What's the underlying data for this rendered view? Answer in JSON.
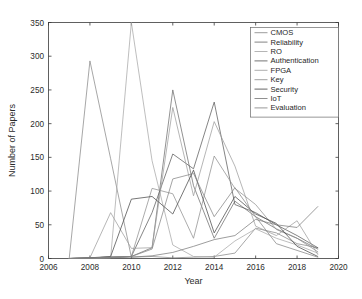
{
  "chart_data": {
    "type": "line",
    "title": "",
    "xlabel": "Year",
    "ylabel": "Number of Papers",
    "xlim": [
      2006,
      2020
    ],
    "ylim": [
      0,
      350
    ],
    "xticks": [
      2006,
      2008,
      2010,
      2012,
      2014,
      2016,
      2018,
      2020
    ],
    "yticks": [
      0,
      50,
      100,
      150,
      200,
      250,
      300,
      350
    ],
    "grid": false,
    "legend_position": "top-right",
    "x": [
      2007,
      2008,
      2009,
      2010,
      2011,
      2012,
      2013,
      2014,
      2015,
      2016,
      2017,
      2018,
      2019
    ],
    "series": [
      {
        "name": "CMOS",
        "color": "#8a8a8a",
        "values": [
          0,
          293,
          148,
          2,
          3,
          1,
          2,
          3,
          8,
          45,
          38,
          22,
          16
        ]
      },
      {
        "name": "Reliability",
        "color": "#6e6e6e",
        "values": [
          0,
          1,
          2,
          3,
          16,
          250,
          108,
          30,
          85,
          62,
          44,
          30,
          14
        ]
      },
      {
        "name": "RO",
        "color": "#a8a8a8",
        "values": [
          0,
          0,
          1,
          350,
          145,
          20,
          3,
          2,
          26,
          44,
          30,
          20,
          8
        ]
      },
      {
        "name": "Authentication",
        "color": "#5c5c5c",
        "values": [
          0,
          1,
          2,
          3,
          68,
          155,
          133,
          232,
          80,
          68,
          50,
          34,
          16
        ]
      },
      {
        "name": "FPGA",
        "color": "#9e9e9e",
        "values": [
          0,
          1,
          68,
          15,
          16,
          224,
          93,
          203,
          137,
          48,
          34,
          56,
          6
        ]
      },
      {
        "name": "Key",
        "color": "#909090",
        "values": [
          0,
          1,
          2,
          3,
          104,
          96,
          30,
          152,
          104,
          80,
          43,
          30,
          10
        ]
      },
      {
        "name": "Security",
        "color": "#4a4a4a",
        "values": [
          0,
          1,
          3,
          88,
          92,
          66,
          131,
          38,
          92,
          66,
          52,
          18,
          3
        ]
      },
      {
        "name": "IoT",
        "color": "#7c7c7c",
        "values": [
          0,
          0,
          1,
          2,
          4,
          9,
          18,
          28,
          34,
          58,
          50,
          46,
          77
        ]
      },
      {
        "name": "Evaluation",
        "color": "#868686",
        "values": [
          0,
          1,
          2,
          3,
          14,
          118,
          126,
          62,
          105,
          62,
          22,
          12,
          2
        ]
      }
    ]
  }
}
